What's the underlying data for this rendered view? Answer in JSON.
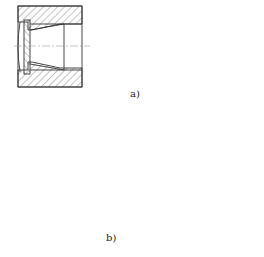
{
  "figure": {
    "subfigures": [
      {
        "id": "a",
        "label": "a)",
        "description": "Bore with internal retaining ring groove (section view) and two circlip front views"
      },
      {
        "id": "b",
        "label": "b)",
        "description": "Two housing section views with inserted bushing/sleeve and retaining ring"
      }
    ]
  },
  "colors": {
    "line": "#333333",
    "hatch": "#555555",
    "background": "#ffffff"
  }
}
